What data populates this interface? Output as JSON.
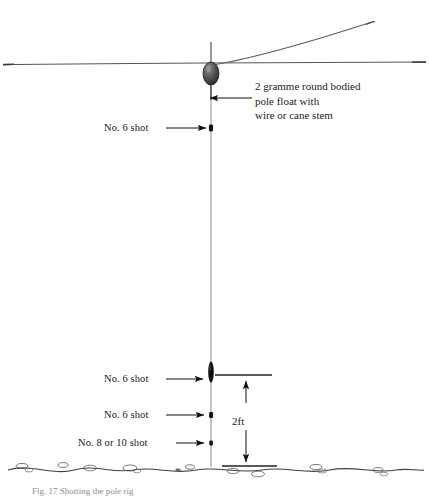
{
  "figure": {
    "caption": "Fig. 17 Shotting the pole rig"
  },
  "colors": {
    "line": "#4a4a4a",
    "water_line": "#555555",
    "bed_line": "#444444",
    "shot_fill": "#151515",
    "float_fill": "#4d4d4d",
    "float_stroke": "#2b2b2b",
    "text": "#1a1a1a",
    "arrow": "#111111"
  },
  "callout": {
    "name": "float-callout",
    "lines": [
      "2 gramme round bodied",
      "pole float with",
      "wire or cane stem"
    ]
  },
  "labels": [
    {
      "id": "shot-label-upper",
      "text": "No. 6 shot",
      "x": 104,
      "y": 122,
      "leader_from_x": 166,
      "leader_to_x": 208,
      "leader_y": 128
    },
    {
      "id": "shot-label-lower-1",
      "text": "No. 6 shot",
      "x": 104,
      "y": 373,
      "leader_from_x": 166,
      "leader_to_x": 205,
      "leader_y": 379
    },
    {
      "id": "shot-label-lower-2",
      "text": "No. 6 shot",
      "x": 104,
      "y": 409,
      "leader_from_x": 166,
      "leader_to_x": 206,
      "leader_y": 415
    },
    {
      "id": "shot-label-lower-3",
      "text": "No. 8 or 10 shot",
      "x": 78,
      "y": 437,
      "leader_from_x": 176,
      "leader_to_x": 206,
      "leader_y": 443
    }
  ],
  "dimension": {
    "name": "depth-dimension",
    "text": "2ft",
    "value": 2,
    "unit": "ft",
    "top_y": 375,
    "bottom_y": 466,
    "arrow_x": 246,
    "tick_left_x": 215,
    "tick_right_x": 272,
    "bottom_tick_left_x": 222,
    "bottom_tick_right_x": 277
  },
  "geometry": {
    "main_line_x": 211,
    "water_line_y": 63,
    "float_center_x": 211,
    "float_center_y": 73,
    "float_rx": 8,
    "float_ry": 11,
    "antenna_top_y": 42,
    "line_bottom_y": 466,
    "bed_y": 468
  },
  "shots": [
    {
      "id": "shot-upper",
      "y": 128,
      "w": 4,
      "h": 7,
      "kind": "small"
    },
    {
      "id": "shot-olivette",
      "y": 372,
      "w": 5,
      "h": 20,
      "kind": "olivette"
    },
    {
      "id": "shot-mid",
      "y": 415,
      "w": 4,
      "h": 6,
      "kind": "small"
    },
    {
      "id": "shot-bottom",
      "y": 443,
      "w": 3.5,
      "h": 5,
      "kind": "small"
    }
  ],
  "pole": {
    "name": "pole-line",
    "description": "angled pole tip line rising to upper right"
  }
}
